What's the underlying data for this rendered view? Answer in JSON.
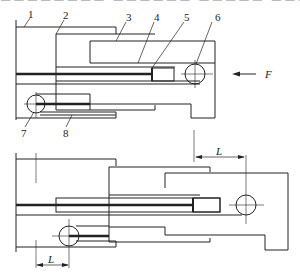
{
  "diagram": {
    "part_labels": [
      "1",
      "2",
      "3",
      "4",
      "5",
      "6",
      "7",
      "8"
    ],
    "force_label": "F",
    "dimension_label_top": "L",
    "dimension_label_bottom": "L",
    "colors": {
      "line": "#222222",
      "background": "#ffffff"
    }
  }
}
